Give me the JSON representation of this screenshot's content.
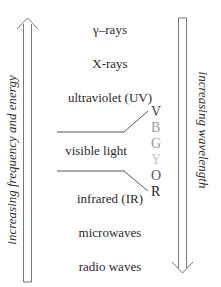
{
  "bands": [
    {
      "label": "γ–rays"
    },
    {
      "label": "X-rays"
    },
    {
      "label": "ultraviolet (UV)"
    },
    {
      "label": "visible light"
    },
    {
      "label": "infrared (IR)"
    },
    {
      "label": "microwaves"
    },
    {
      "label": "radio waves"
    }
  ],
  "visible_spectrum": [
    {
      "letter": "V",
      "color": "#444444"
    },
    {
      "letter": "B",
      "color": "#9a9a9a"
    },
    {
      "letter": "G",
      "color": "#9a9a9a"
    },
    {
      "letter": "Y",
      "color": "#c4c4c4"
    },
    {
      "letter": "O",
      "color": "#555555"
    },
    {
      "letter": "R",
      "color": "#222222"
    }
  ],
  "left_axis": {
    "label": "increasing frequency and energy",
    "direction": "up"
  },
  "right_axis": {
    "label": "increasing wavelength",
    "direction": "down"
  },
  "colors": {
    "line": "#777777",
    "text": "#2a2a2a"
  }
}
